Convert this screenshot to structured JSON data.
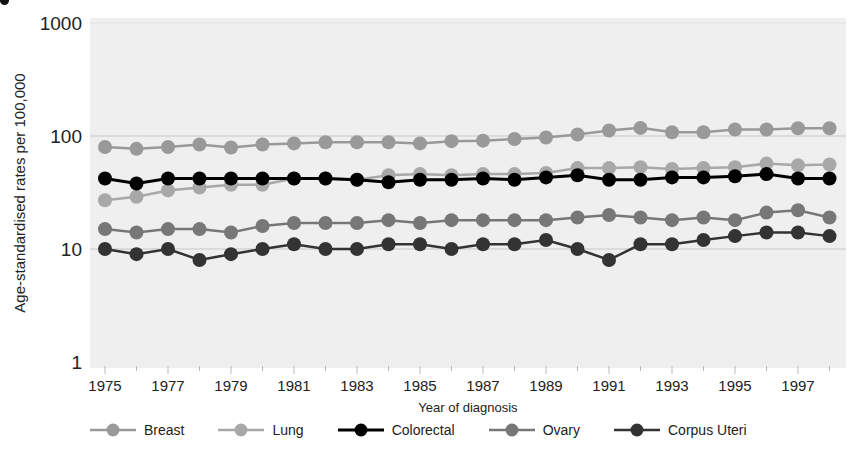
{
  "chart_data": {
    "type": "line",
    "title": "",
    "xlabel": "Year of diagnosis",
    "ylabel": "Age-standardised rates per 100,000",
    "yscale": "log",
    "ylim": [
      1,
      1000
    ],
    "yticks": [
      "1",
      "10",
      "100",
      "1000"
    ],
    "xticks": [
      "1975",
      "1977",
      "1979",
      "1981",
      "1983",
      "1985",
      "1987",
      "1989",
      "1991",
      "1993",
      "1995",
      "1997"
    ],
    "grid": "horizontal at 10 and 100",
    "legend_position": "bottom",
    "x": [
      1975,
      1976,
      1977,
      1978,
      1979,
      1980,
      1981,
      1982,
      1983,
      1984,
      1985,
      1986,
      1987,
      1988,
      1989,
      1990,
      1991,
      1992,
      1993,
      1994,
      1995,
      1996,
      1997,
      1998
    ],
    "series": [
      {
        "name": "Breast",
        "color": "#999999",
        "values": [
          80,
          77,
          80,
          84,
          79,
          84,
          86,
          88,
          88,
          88,
          86,
          90,
          91,
          94,
          97,
          103,
          112,
          118,
          108,
          108,
          114,
          114,
          117,
          117
        ]
      },
      {
        "name": "Lung",
        "color": "#a8a8a8",
        "values": [
          27,
          29,
          33,
          35,
          37,
          37,
          42,
          42,
          41,
          45,
          46,
          45,
          46,
          46,
          47,
          52,
          52,
          53,
          51,
          52,
          53,
          57,
          55,
          56
        ]
      },
      {
        "name": "Colorectal",
        "color": "#000000",
        "values": [
          42,
          38,
          42,
          42,
          42,
          42,
          42,
          42,
          41,
          39,
          41,
          41,
          42,
          41,
          43,
          45,
          41,
          41,
          43,
          43,
          44,
          46,
          42,
          42
        ]
      },
      {
        "name": "Ovary",
        "color": "#777777",
        "values": [
          15,
          14,
          15,
          15,
          14,
          16,
          17,
          17,
          17,
          18,
          17,
          18,
          18,
          18,
          18,
          19,
          20,
          19,
          18,
          19,
          18,
          21,
          22,
          19
        ]
      },
      {
        "name": "Corpus Uteri",
        "color": "#333333",
        "values": [
          10,
          9,
          10,
          8,
          9,
          10,
          11,
          10,
          10,
          11,
          11,
          10,
          11,
          11,
          12,
          10,
          8,
          11,
          11,
          12,
          13,
          14,
          14,
          13
        ]
      }
    ]
  },
  "legend": {
    "items": [
      {
        "label": "Breast",
        "color": "#999999"
      },
      {
        "label": "Lung",
        "color": "#a8a8a8"
      },
      {
        "label": "Colorectal",
        "color": "#000000"
      },
      {
        "label": "Ovary",
        "color": "#777777"
      },
      {
        "label": "Corpus Uteri",
        "color": "#333333"
      }
    ]
  },
  "colors": {
    "plot_background": "#efefef",
    "gridline": "#c8c8c8"
  }
}
